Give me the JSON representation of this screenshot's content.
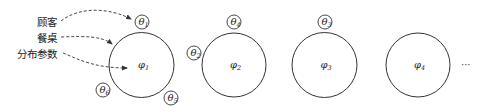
{
  "diagram": {
    "type": "chinese-restaurant-process",
    "colors": {
      "stroke": "#333333",
      "text": "#222222",
      "background": "#ffffff"
    },
    "legend_labels": [
      {
        "id": "customer",
        "text": "顾客",
        "arrow_target": "theta-1"
      },
      {
        "id": "table",
        "text": "餐桌",
        "arrow_target": "table-1"
      },
      {
        "id": "distribution-parameter",
        "text": "分布参数",
        "arrow_target": "phi-1"
      }
    ],
    "tables": [
      {
        "id": "table-1",
        "param": {
          "symbol": "φ",
          "sub": "1"
        },
        "customers": [
          {
            "symbol": "θ",
            "sub": "1",
            "position": "top"
          },
          {
            "symbol": "θ",
            "sub": "6",
            "position": "bottom-left"
          },
          {
            "symbol": "θ",
            "sub": "5",
            "position": "bottom-right"
          }
        ]
      },
      {
        "id": "table-2",
        "param": {
          "symbol": "φ",
          "sub": "2"
        },
        "customers": [
          {
            "symbol": "θ",
            "sub": "4",
            "position": "top"
          },
          {
            "symbol": "θ",
            "sub": "2",
            "position": "left"
          }
        ]
      },
      {
        "id": "table-3",
        "param": {
          "symbol": "φ",
          "sub": "3"
        },
        "customers": [
          {
            "symbol": "θ",
            "sub": "3",
            "position": "top"
          }
        ]
      },
      {
        "id": "table-4",
        "param": {
          "symbol": "φ",
          "sub": "4"
        },
        "customers": []
      }
    ],
    "continuation": "···"
  }
}
